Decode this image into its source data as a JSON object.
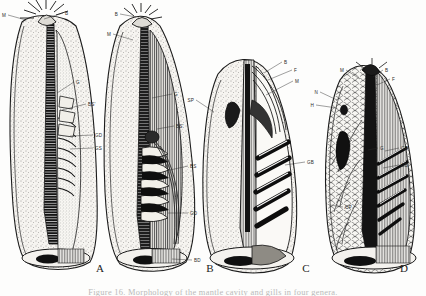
{
  "figure": {
    "caption": "Figure 16.  Morphology of the mantle cavity and gills in four genera.",
    "background_color": "#fdfdfc",
    "ink_color": "#222222",
    "panel_count": 4
  },
  "panels": [
    {
      "id": "A",
      "letter": "A",
      "letter_x": 100,
      "letter_y": 272,
      "labels": [
        {
          "text": "M",
          "lx": 8,
          "ly": 15,
          "tx": 26,
          "ty": 20
        },
        {
          "text": "B",
          "lx": 63,
          "ly": 13,
          "tx": 44,
          "ty": 19
        },
        {
          "text": "G",
          "lx": 74,
          "ly": 82,
          "tx": 57,
          "ty": 93
        },
        {
          "text": "BS'",
          "lx": 86,
          "ly": 104,
          "tx": 62,
          "ty": 110
        },
        {
          "text": "GD",
          "lx": 93,
          "ly": 135,
          "tx": 70,
          "ty": 136
        },
        {
          "text": "GS",
          "lx": 93,
          "ly": 148,
          "tx": 70,
          "ty": 149
        }
      ]
    },
    {
      "id": "B",
      "letter": "B",
      "letter_x": 210,
      "letter_y": 272,
      "labels": [
        {
          "text": "B",
          "lx": 120,
          "ly": 14,
          "tx": 136,
          "ty": 17
        },
        {
          "text": "M",
          "lx": 113,
          "ly": 34,
          "tx": 133,
          "ty": 40
        },
        {
          "text": "G",
          "lx": 172,
          "ly": 94,
          "tx": 152,
          "ty": 98
        },
        {
          "text": "BS'",
          "lx": 174,
          "ly": 126,
          "tx": 157,
          "ty": 129
        },
        {
          "text": "BS",
          "lx": 188,
          "ly": 166,
          "tx": 170,
          "ty": 170
        },
        {
          "text": "GD",
          "lx": 188,
          "ly": 213,
          "tx": 168,
          "ty": 213
        },
        {
          "text": "BD",
          "lx": 192,
          "ly": 260,
          "tx": 172,
          "ty": 259
        }
      ]
    },
    {
      "id": "C",
      "letter": "C",
      "letter_x": 306,
      "letter_y": 272,
      "labels": [
        {
          "text": "SP",
          "lx": 196,
          "ly": 100,
          "tx": 214,
          "ty": 112
        },
        {
          "text": "B",
          "lx": 282,
          "ly": 62,
          "tx": 264,
          "ty": 73
        },
        {
          "text": "F",
          "lx": 292,
          "ly": 70,
          "tx": 268,
          "ty": 80
        },
        {
          "text": "M",
          "lx": 293,
          "ly": 81,
          "tx": 266,
          "ty": 95
        },
        {
          "text": "GB",
          "lx": 305,
          "ly": 162,
          "tx": 285,
          "ty": 165
        }
      ]
    },
    {
      "id": "D",
      "letter": "D",
      "letter_x": 404,
      "letter_y": 272,
      "labels": [
        {
          "text": "M",
          "lx": 346,
          "ly": 70,
          "tx": 360,
          "ty": 79
        },
        {
          "text": "B",
          "lx": 383,
          "ly": 70,
          "tx": 373,
          "ty": 77
        },
        {
          "text": "F",
          "lx": 390,
          "ly": 79,
          "tx": 377,
          "ty": 85
        },
        {
          "text": "N",
          "lx": 320,
          "ly": 92,
          "tx": 337,
          "ty": 100
        },
        {
          "text": "H",
          "lx": 316,
          "ly": 105,
          "tx": 337,
          "ty": 108
        },
        {
          "text": "G",
          "lx": 378,
          "ly": 148,
          "tx": 368,
          "ty": 150
        },
        {
          "text": "GR",
          "lx": 399,
          "ly": 148,
          "tx": 385,
          "ty": 151
        },
        {
          "text": "GB",
          "lx": 399,
          "ly": 165,
          "tx": 383,
          "ty": 168
        },
        {
          "text": "CP",
          "lx": 343,
          "ly": 207,
          "tx": 330,
          "ty": 205
        }
      ]
    }
  ]
}
